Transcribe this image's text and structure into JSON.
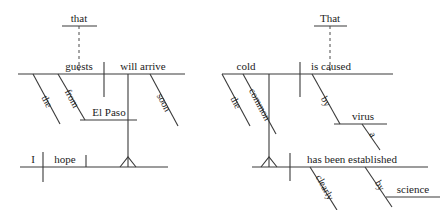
{
  "image": {
    "title": "Reed-Kellogg sentence diagrams",
    "width": 444,
    "height": 210,
    "background_color": "#ffffff",
    "line_color": "#3a3a3a",
    "text_color": "#1c1c1c"
  },
  "diagrams": [
    {
      "id": "left-diagram",
      "sentence": "I hope that the guests from El Paso will arrive soon.",
      "words": {
        "subordinator": "that",
        "subject": "guests",
        "predicate": "will arrive",
        "subject_mod_1": "the",
        "subject_mod_2": "from",
        "prep_object": "El Paso",
        "predicate_mod": "soon",
        "main_subject": "I",
        "main_verb": "hope"
      }
    },
    {
      "id": "right-diagram",
      "sentence": "That the common cold is caused by a virus has been clearly established by science.",
      "words": {
        "subordinator": "That",
        "subject": "cold",
        "predicate": "is caused",
        "subject_mod_1": "the",
        "subject_mod_2": "common",
        "agent_prep": "by",
        "agent_object": "virus",
        "agent_object_mod": "a",
        "main_predicate": "has been established",
        "main_mod_1": "clearly",
        "main_mod_2": "by",
        "main_prep_object": "science"
      }
    }
  ],
  "labels": {
    "l_that": "that",
    "l_guests": "guests",
    "l_will_arrive": "will arrive",
    "l_the": "the",
    "l_from": "from",
    "l_el_paso": "El Paso",
    "l_soon": "soon",
    "l_i": "I",
    "l_hope": "hope",
    "r_That": "That",
    "r_cold": "cold",
    "r_is_caused": "is caused",
    "r_the": "the",
    "r_common": "common",
    "r_by1": "by",
    "r_virus": "virus",
    "r_a": "a",
    "r_has_been_established": "has been established",
    "r_clearly": "clearly",
    "r_by2": "by",
    "r_science": "science"
  }
}
